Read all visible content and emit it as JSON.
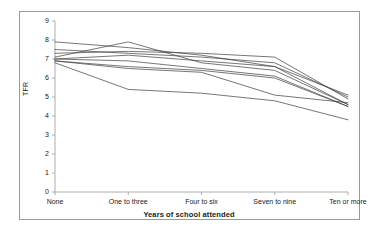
{
  "chart_data": {
    "type": "line",
    "title": "",
    "xlabel": "Years of school attended",
    "ylabel": "TFR",
    "categories": [
      "None",
      "One to three",
      "Four to six",
      "Seven to nine",
      "Ten or more"
    ],
    "ylim": [
      0,
      9
    ],
    "yticks": [
      0,
      1,
      2,
      3,
      4,
      5,
      6,
      7,
      8,
      9
    ],
    "ytick_labels": [
      "0",
      "1",
      "2",
      "3",
      "4",
      "5",
      "6",
      "7",
      "8",
      "9"
    ],
    "grid": false,
    "legend": "none",
    "line_color": "#3c3c3c",
    "series": [
      {
        "name": "series-1",
        "values": [
          7.9,
          7.6,
          7.2,
          6.6,
          4.6
        ]
      },
      {
        "name": "series-2",
        "values": [
          7.5,
          7.3,
          7.1,
          6.8,
          5.0
        ]
      },
      {
        "name": "series-3",
        "values": [
          7.3,
          7.4,
          7.3,
          7.1,
          4.9
        ]
      },
      {
        "name": "series-4",
        "values": [
          7.1,
          7.9,
          6.8,
          6.4,
          4.6
        ]
      },
      {
        "name": "series-5",
        "values": [
          7.0,
          7.2,
          6.9,
          6.6,
          5.1
        ]
      },
      {
        "name": "series-6",
        "values": [
          7.0,
          6.9,
          6.5,
          6.1,
          4.5
        ]
      },
      {
        "name": "series-7",
        "values": [
          6.9,
          6.6,
          6.4,
          6.0,
          4.5
        ]
      },
      {
        "name": "series-8",
        "values": [
          6.9,
          6.5,
          6.3,
          5.1,
          4.7
        ]
      },
      {
        "name": "series-9",
        "values": [
          6.8,
          5.4,
          5.2,
          4.8,
          3.8
        ]
      }
    ],
    "axis_color": "#9a9a9a"
  }
}
